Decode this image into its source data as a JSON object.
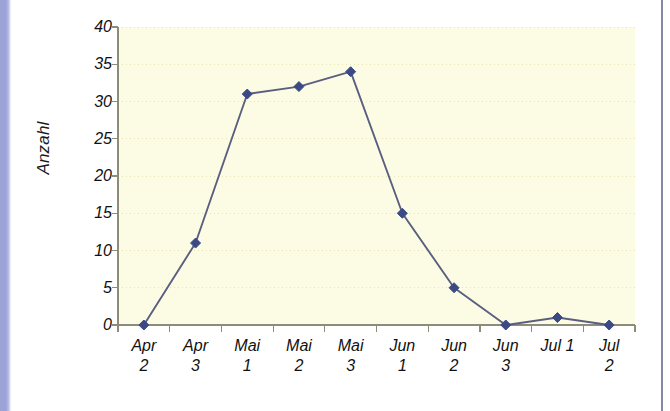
{
  "chart_data": {
    "type": "line",
    "title": "",
    "xlabel": "",
    "ylabel": "Anzahl",
    "categories": [
      "Apr 2",
      "Apr 3",
      "Mai 1",
      "Mai 2",
      "Mai 3",
      "Jun 1",
      "Jun 2",
      "Jun 3",
      "Jul 1",
      "Jul 2"
    ],
    "category_lines": [
      [
        "Apr",
        "2"
      ],
      [
        "Apr",
        "3"
      ],
      [
        "Mai",
        "1"
      ],
      [
        "Mai",
        "2"
      ],
      [
        "Mai",
        "3"
      ],
      [
        "Jun",
        "1"
      ],
      [
        "Jun",
        "2"
      ],
      [
        "Jun",
        "3"
      ],
      [
        "Jul 1",
        ""
      ],
      [
        "Jul 2",
        ""
      ]
    ],
    "values": [
      0,
      11,
      31,
      32,
      34,
      15,
      5,
      0,
      1,
      0
    ],
    "ylim": [
      0,
      40
    ],
    "ytick_labels": [
      "0",
      "5",
      "10",
      "15",
      "20",
      "25",
      "30",
      "35",
      "40"
    ],
    "ytick_values": [
      0,
      5,
      10,
      15,
      20,
      25,
      30,
      35,
      40
    ],
    "grid": true,
    "grid_style": "dotted-horizontal",
    "legend": "none",
    "marker": "diamond"
  },
  "colors": {
    "plot_background": "#fcfce4",
    "page_background": "#ffffff",
    "series_line": "#5a5f80",
    "marker_fill": "#3b4a84",
    "gridline": "#e6e2bb",
    "axis_line": "#8c8c78",
    "left_band": "#9aa2d8",
    "right_rule": "#6f7593",
    "tick_text": "#111111"
  },
  "axis_title": {
    "y": "Anzahl"
  }
}
